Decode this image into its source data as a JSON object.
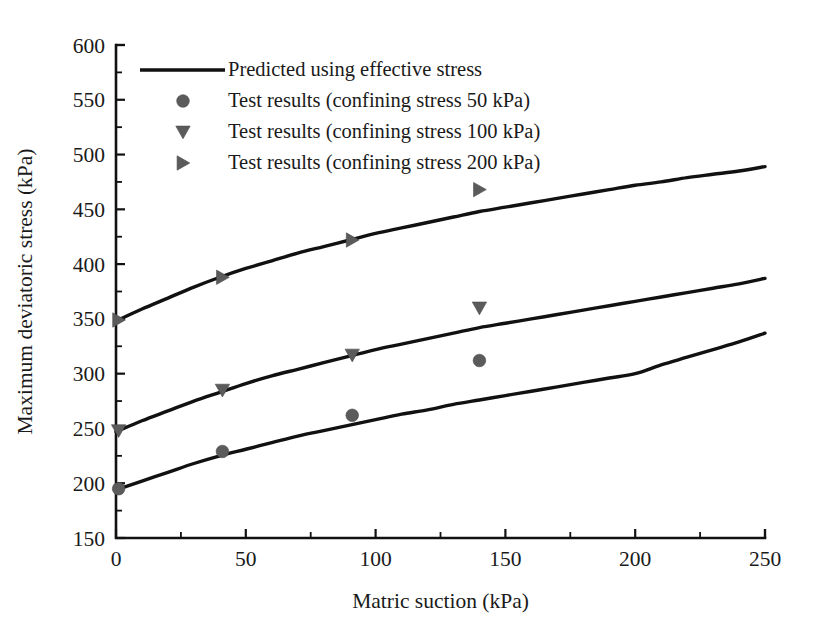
{
  "chart_data": {
    "type": "line",
    "title": "",
    "xlabel": "Matric suction (kPa)",
    "ylabel": "Maximum deviatoric stress (kPa)",
    "xlim": [
      0,
      250
    ],
    "ylim": [
      150,
      600
    ],
    "xticks": [
      0,
      50,
      100,
      150,
      200,
      250
    ],
    "xtick_labels": [
      "0",
      "50",
      "100",
      "150",
      "200",
      "250"
    ],
    "xminor_step": 25,
    "yticks": [
      150,
      200,
      250,
      300,
      350,
      400,
      450,
      500,
      550,
      600
    ],
    "ytick_labels": [
      "150",
      "200",
      "250",
      "300",
      "350",
      "400",
      "450",
      "500",
      "550",
      "600"
    ],
    "yminor_step": 25,
    "grid": false,
    "legend_position": "upper-left-inside",
    "legend": [
      {
        "label": "Predicted using effective stress",
        "marker": "line",
        "color": "#111111"
      },
      {
        "label": "Test results (confining stress 50 kPa)",
        "marker": "circle",
        "color": "#5b5b5b"
      },
      {
        "label": "Test results (confining stress 100 kPa)",
        "marker": "triangle-down",
        "color": "#5b5b5b"
      },
      {
        "label": "Test results (confining stress 200 kPa)",
        "marker": "triangle-right",
        "color": "#5b5b5b"
      }
    ],
    "series": [
      {
        "name": "Predicted using effective stress (confining stress 200 kPa)",
        "type": "line",
        "marker": "line",
        "color": "#111111",
        "x": [
          0,
          10,
          20,
          30,
          40,
          50,
          60,
          70,
          80,
          90,
          100,
          110,
          120,
          130,
          140,
          150,
          160,
          170,
          180,
          190,
          200,
          210,
          220,
          230,
          240,
          250
        ],
        "y": [
          348,
          359,
          369,
          379,
          388,
          396,
          403,
          410,
          416,
          422,
          428,
          433,
          438,
          443,
          448,
          452,
          456,
          460,
          464,
          468,
          472,
          475,
          479,
          482,
          485,
          489
        ]
      },
      {
        "name": "Predicted using effective stress (confining stress 100 kPa)",
        "type": "line",
        "marker": "line",
        "color": "#111111",
        "x": [
          0,
          10,
          20,
          30,
          40,
          50,
          60,
          70,
          80,
          90,
          100,
          110,
          120,
          130,
          140,
          150,
          160,
          170,
          180,
          190,
          200,
          210,
          220,
          230,
          240,
          250
        ],
        "y": [
          247,
          257,
          266,
          275,
          283,
          291,
          298,
          304,
          310,
          316,
          322,
          327,
          332,
          337,
          342,
          346,
          350,
          354,
          358,
          362,
          366,
          370,
          374,
          378,
          382,
          387
        ]
      },
      {
        "name": "Predicted using effective stress (confining stress 50 kPa)",
        "type": "line",
        "marker": "line",
        "color": "#111111",
        "x": [
          0,
          10,
          20,
          30,
          40,
          50,
          60,
          70,
          80,
          90,
          100,
          110,
          120,
          130,
          140,
          150,
          160,
          170,
          180,
          190,
          200,
          210,
          220,
          230,
          240,
          250
        ],
        "y": [
          194,
          202,
          210,
          218,
          225,
          231,
          237,
          243,
          248,
          253,
          258,
          263,
          267,
          272,
          276,
          280,
          284,
          288,
          292,
          296,
          300,
          308,
          315,
          322,
          329,
          337
        ]
      },
      {
        "name": "Test results (confining stress 200 kPa)",
        "type": "scatter",
        "marker": "triangle-right",
        "color": "#5b5b5b",
        "x": [
          1,
          41,
          91,
          140
        ],
        "y": [
          349,
          388,
          422,
          468
        ]
      },
      {
        "name": "Test results (confining stress 100 kPa)",
        "type": "scatter",
        "marker": "triangle-down",
        "color": "#5b5b5b",
        "x": [
          1,
          41,
          91,
          140
        ],
        "y": [
          248,
          285,
          317,
          360
        ]
      },
      {
        "name": "Test results (confining stress 50 kPa)",
        "type": "scatter",
        "marker": "circle",
        "color": "#5b5b5b",
        "x": [
          1,
          41,
          91,
          140
        ],
        "y": [
          195,
          229,
          262,
          312
        ]
      }
    ]
  }
}
